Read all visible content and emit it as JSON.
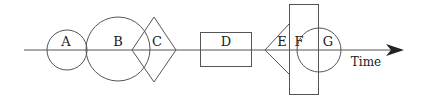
{
  "diagram": {
    "axis_label": "Time",
    "stroke_color": "#555555",
    "shapes": [
      {
        "id": "A",
        "label": "A",
        "type": "circle"
      },
      {
        "id": "B",
        "label": "B",
        "type": "circle"
      },
      {
        "id": "C",
        "label": "C",
        "type": "diamond"
      },
      {
        "id": "D",
        "label": "D",
        "type": "rectangle"
      },
      {
        "id": "E",
        "label": "E",
        "type": "triangle"
      },
      {
        "id": "F",
        "label": "F",
        "type": "rectangle"
      },
      {
        "id": "G",
        "label": "G",
        "type": "circle"
      }
    ]
  }
}
